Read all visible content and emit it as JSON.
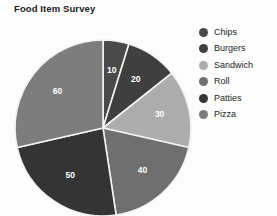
{
  "chart_data": {
    "type": "pie",
    "title": "Food Item Survey",
    "xlabel": "",
    "ylabel": "",
    "categories": [
      "Chips",
      "Burgers",
      "Sandwich",
      "Roll",
      "Patties",
      "Pizza"
    ],
    "values": [
      10,
      20,
      30,
      40,
      50,
      60
    ],
    "total": 210,
    "labels_shown": [
      "10",
      "20",
      "30",
      "40",
      "50",
      "60"
    ],
    "label_color": "#ffffff",
    "slice_colors": [
      "#4a4a4a",
      "#3f3f3f",
      "#adadad",
      "#6f6f6f",
      "#343434",
      "#7d7d7d"
    ],
    "separator_color": "#f2f2f2",
    "start_angle_deg": 0,
    "direction": "clockwise",
    "legend_position": "right",
    "legend": [
      {
        "label": "Chips",
        "color": "#4a4a4a",
        "value": 10
      },
      {
        "label": "Burgers",
        "color": "#3f3f3f",
        "value": 20
      },
      {
        "label": "Sandwich",
        "color": "#adadad",
        "value": 30
      },
      {
        "label": "Roll",
        "color": "#6f6f6f",
        "value": 40
      },
      {
        "label": "Patties",
        "color": "#343434",
        "value": 50
      },
      {
        "label": "Pizza",
        "color": "#7d7d7d",
        "value": 60
      }
    ],
    "grid": false,
    "background": "#fdfdfd",
    "clipped_bottom": true
  },
  "chart": {
    "title": "Food Item Survey"
  }
}
